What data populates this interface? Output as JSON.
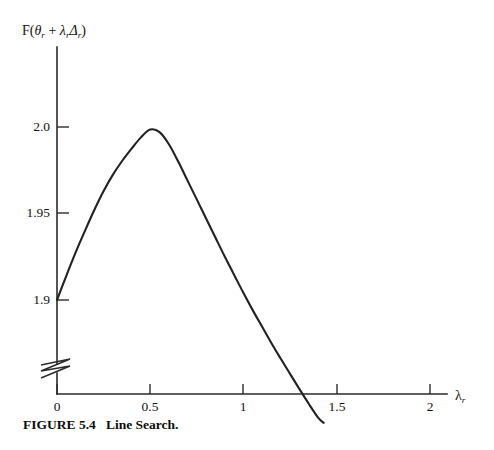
{
  "figure": {
    "caption_number": "FIGURE 5.4",
    "caption_text": "Line Search.",
    "caption_full": "FIGURE 5.4   Line Search."
  },
  "axes": {
    "y_label_prefix": "F(",
    "y_label_theta": "θ",
    "y_label_theta_sub": "r",
    "y_label_plus": " + ",
    "y_label_lambda": "λ",
    "y_label_lambda_sub": "r",
    "y_label_delta": "Δ",
    "y_label_delta_sub": "r",
    "y_label_suffix": ")",
    "x_label_lambda": "λ",
    "x_label_lambda_sub": "r",
    "y_ticks": [
      "2.0",
      "1.95",
      "1.9"
    ],
    "x_ticks": [
      "0",
      "0.5",
      "1",
      "1.5",
      "2"
    ],
    "axis_break_symbol": "zigzag-break"
  },
  "chart_data": {
    "type": "line",
    "title": "",
    "subtitle": "",
    "xlabel": "λ_r",
    "ylabel": "F(θ_r + λ_rΔ_r)",
    "xlim": [
      0,
      2
    ],
    "ylim": [
      1.9,
      2.0
    ],
    "xticks": [
      0,
      0.5,
      1,
      1.5,
      2
    ],
    "xticklabels": [
      "0",
      "0.5",
      "1",
      "1.5",
      "2"
    ],
    "yticks": [
      1.9,
      1.95,
      2.0
    ],
    "yticklabels": [
      "1.9",
      "1.95",
      "2.0"
    ],
    "y_axis_broken_below": 1.9,
    "grid": false,
    "legend": null,
    "annotations": [],
    "series": [
      {
        "name": "F(θ_r + λ_rΔ_r)",
        "color": "#222222",
        "x": [
          0.0,
          0.05,
          0.1,
          0.15,
          0.2,
          0.25,
          0.3,
          0.35,
          0.4,
          0.45,
          0.5,
          0.55,
          0.6,
          0.65,
          0.7,
          0.75,
          0.8,
          0.85,
          0.9,
          0.95,
          1.0,
          1.05,
          1.1,
          1.15,
          1.2,
          1.25,
          1.3,
          1.35,
          1.4,
          1.43
        ],
        "y": [
          1.9,
          1.914,
          1.9275,
          1.94,
          1.952,
          1.963,
          1.9725,
          1.9805,
          1.9875,
          1.994,
          1.9985,
          1.997,
          1.99,
          1.98,
          1.969,
          1.958,
          1.947,
          1.936,
          1.925,
          1.9145,
          1.904,
          1.894,
          1.8845,
          1.875,
          1.866,
          1.8572,
          1.8485,
          1.84,
          1.832,
          1.829
        ],
        "peak_x": 0.5,
        "peak_y": 2.0,
        "start_x": 0.0,
        "start_y": 1.9,
        "end_x": 1.43,
        "end_y": 1.829
      }
    ]
  }
}
